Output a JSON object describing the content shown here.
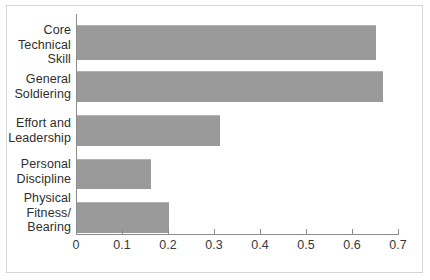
{
  "chart_data": {
    "type": "bar",
    "orientation": "horizontal",
    "title": "",
    "subtitle": "",
    "xlabel": "",
    "ylabel": "",
    "categories": [
      "Core Technical Skill",
      "General Soldiering",
      "Effort and Leadership",
      "Personal Discipline",
      "Physical Fitness/ Bearing"
    ],
    "category_lines": [
      [
        "Core",
        "Technical",
        "Skill"
      ],
      [
        "General",
        "Soldiering"
      ],
      [
        "Effort and",
        "Leadership"
      ],
      [
        "Personal",
        "Discipline"
      ],
      [
        "Physical",
        "Fitness/",
        "Bearing"
      ]
    ],
    "values": [
      0.65,
      0.665,
      0.31,
      0.16,
      0.2
    ],
    "xlim": [
      0,
      0.7
    ],
    "xticks": [
      0,
      0.1,
      0.2,
      0.3,
      0.4,
      0.5,
      0.6,
      0.7
    ],
    "xtick_labels": [
      "0",
      "0.1",
      "0.2",
      "0.3",
      "0.4",
      "0.5",
      "0.6",
      "0.7"
    ],
    "grid": false,
    "legend": "none",
    "bar_color": "#9a9a9a",
    "axis_color": "#8c8c8c",
    "frame_color": "#d6d6d6",
    "background": "#ffffff"
  }
}
